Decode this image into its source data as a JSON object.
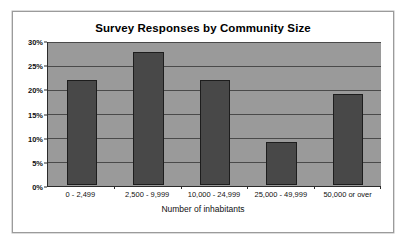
{
  "chart_data": {
    "type": "bar",
    "title": "Survey Responses by Community Size",
    "xlabel": "Number of inhabitants",
    "ylabel": "",
    "categories": [
      "0 - 2,499",
      "2,500 - 9,999",
      "10,000 - 24,999",
      "25,000 - 49,999",
      "50,000 or over"
    ],
    "values": [
      22,
      28,
      22,
      9,
      19
    ],
    "ylim": [
      0,
      30
    ],
    "ytick_values": [
      0,
      5,
      10,
      15,
      20,
      25,
      30
    ],
    "ytick_labels": [
      "0%",
      "5%",
      "10%",
      "15%",
      "20%",
      "25%",
      "30%"
    ],
    "grid": true,
    "legend": false,
    "value_unit": "%",
    "colors": {
      "bar_fill": "#484848",
      "bar_border": "#1d1d1d",
      "plot_background": "#9a9a9a",
      "gridline": "#4a4a4a",
      "axis": "#2b2b2b",
      "frame_border": "#9b9b9b",
      "page_background": "#ffffff",
      "text": "#111111"
    }
  }
}
